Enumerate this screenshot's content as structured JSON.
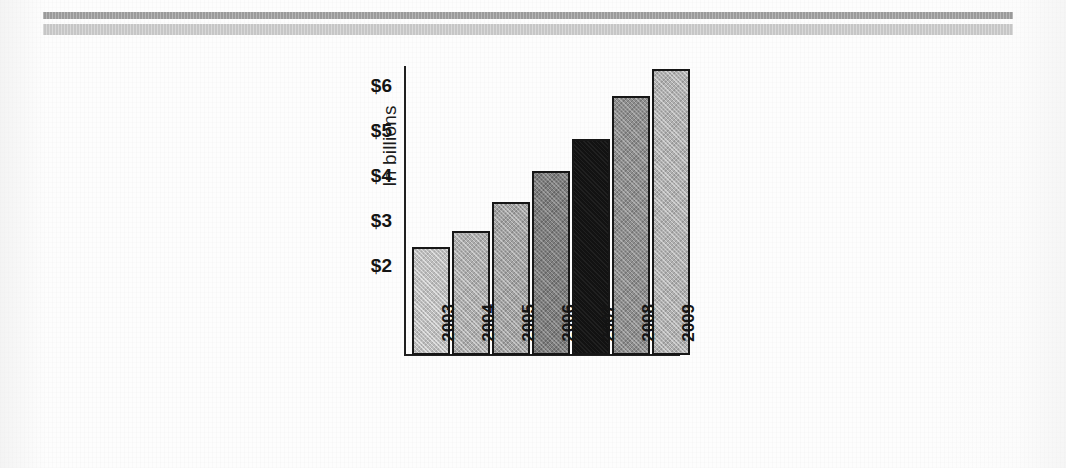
{
  "page": {
    "background_color": "#fdfdfd",
    "rules": [
      {
        "name": "upper-rule",
        "color": "#9a9a9a"
      },
      {
        "name": "lower-rule",
        "color": "#c6c6c6"
      }
    ]
  },
  "chart_data": {
    "type": "bar",
    "title": "",
    "xlabel": "",
    "ylabel": "In billions",
    "categories": [
      "2003",
      "2004",
      "2005",
      "2006",
      "2007",
      "2008",
      "2009"
    ],
    "values": [
      2.4,
      2.75,
      3.4,
      4.1,
      4.8,
      5.75,
      6.35
    ],
    "ytick_labels": [
      "$6",
      "$5",
      "$4",
      "$3",
      "$2"
    ],
    "ytick_values": [
      6,
      5,
      4,
      3,
      2
    ],
    "ylim": [
      0,
      6.55
    ],
    "grid": false,
    "legend": false,
    "bar_colors": [
      "#bcbcbc",
      "#acacac",
      "#a2a2a2",
      "#7e7e7e",
      "#121212",
      "#8e8e8e",
      "#b0b0b0"
    ],
    "bar_outline_color": "#161616",
    "axis_color": "#1f1f1f",
    "highlight_category": "2007"
  }
}
